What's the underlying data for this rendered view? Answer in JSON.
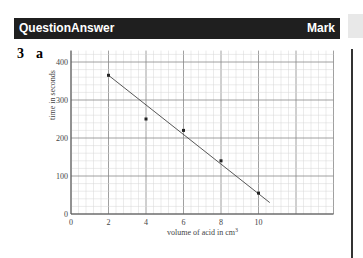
{
  "header": {
    "question_label": "Question",
    "answer_label": "Answer",
    "mark_label": "Mark",
    "background": "#1f1f1f"
  },
  "question": {
    "number": "3",
    "part": "a"
  },
  "chart_data": {
    "type": "scatter",
    "title": "",
    "xlabel": "volume of acid in cm³",
    "ylabel": "time in seconds",
    "x_ticks": [
      "0",
      "2",
      "4",
      "6",
      "8",
      "10"
    ],
    "y_ticks": [
      "0",
      "100",
      "200",
      "300",
      "400"
    ],
    "xlim": [
      0,
      14
    ],
    "ylim": [
      0,
      430
    ],
    "grid": true,
    "series": [
      {
        "name": "data points",
        "x": [
          2,
          4,
          6,
          8,
          10
        ],
        "y": [
          365,
          250,
          220,
          140,
          55
        ]
      },
      {
        "name": "line of best fit",
        "type": "line",
        "x": [
          2,
          10.6
        ],
        "y": [
          365,
          30
        ]
      }
    ]
  }
}
